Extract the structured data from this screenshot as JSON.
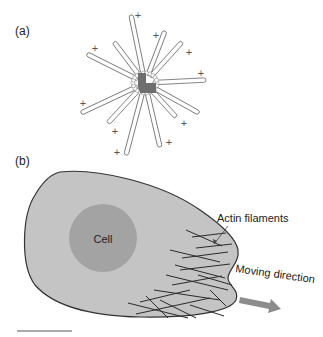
{
  "panels": {
    "a": {
      "label": "(a)",
      "plus_sign": "+",
      "microtubule_count": 12,
      "plus_end_count": 12
    },
    "b": {
      "label": "(b)",
      "nucleus_label": "Cell",
      "filaments_label": "Actin filaments",
      "direction_label": "Moving direction"
    }
  },
  "colors": {
    "cell_fill": "#c4c4c4",
    "nucleus_fill": "#a3a3a3",
    "outline": "#333333",
    "arrow": "#8c8c8c",
    "centrosome": "#6e6e6e"
  }
}
